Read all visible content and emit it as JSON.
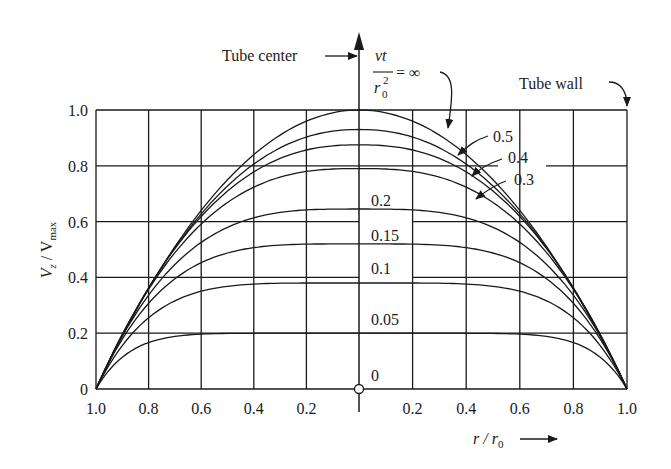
{
  "chart_data": {
    "type": "line",
    "title": "",
    "xlabel": "r / r0",
    "ylabel": "Vz / Vmax",
    "xlim": [
      -1.0,
      1.0
    ],
    "ylim": [
      0,
      1.0
    ],
    "grid": true,
    "x_tick_labels": [
      "1.0",
      "0.8",
      "0.6",
      "0.4",
      "0.2",
      "",
      "0.2",
      "0.4",
      "0.6",
      "0.8",
      "1.0"
    ],
    "y_tick_labels": [
      "0",
      "0.2",
      "0.4",
      "0.6",
      "0.8",
      "1.0"
    ],
    "parameter_label": "vt / r0^2",
    "series": [
      {
        "name": "∞",
        "center_value": 1.0,
        "shape_exponent": 2.0
      },
      {
        "name": "0.5",
        "center_value": 0.93,
        "shape_exponent": 2.2
      },
      {
        "name": "0.4",
        "center_value": 0.875,
        "shape_exponent": 2.4
      },
      {
        "name": "0.3",
        "center_value": 0.79,
        "shape_exponent": 2.7
      },
      {
        "name": "0.2",
        "center_value": 0.645,
        "shape_exponent": 3.3
      },
      {
        "name": "0.15",
        "center_value": 0.52,
        "shape_exponent": 4.0
      },
      {
        "name": "0.1",
        "center_value": 0.38,
        "shape_exponent": 5.0
      },
      {
        "name": "0.05",
        "center_value": 0.2,
        "shape_exponent": 8.0
      },
      {
        "name": "0",
        "center_value": 0.0,
        "shape_exponent": 2.0
      }
    ],
    "annotations": {
      "tube_center": "Tube center",
      "tube_wall": "Tube wall",
      "param_numer": "vt",
      "param_denom_base": "r",
      "param_denom_sup": "2",
      "param_denom_sub": "0",
      "param_eq": "= ∞",
      "curve_labels": [
        "0.5",
        "0.4",
        "0.3",
        "0.2",
        "0.15",
        "0.1",
        "0.05",
        "0"
      ],
      "x_axis_label_main": "r / r",
      "x_axis_label_sub": "0",
      "y_axis_label_main": "V",
      "y_axis_label_sub1": "z",
      "y_axis_label_mid": " / V",
      "y_axis_label_sub2": "max"
    }
  }
}
